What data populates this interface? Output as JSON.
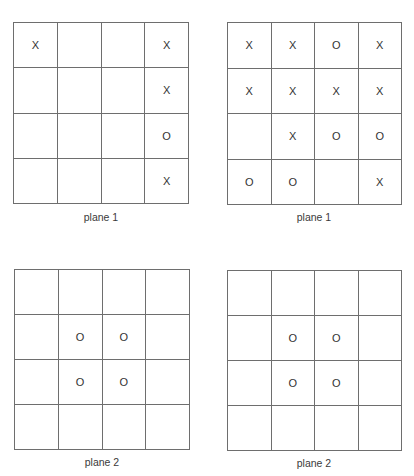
{
  "boards": [
    {
      "id": "top-left",
      "label": "plane 1",
      "cells": [
        [
          "X",
          "",
          "",
          "X"
        ],
        [
          "",
          "",
          "",
          "X"
        ],
        [
          "",
          "",
          "",
          "O"
        ],
        [
          "",
          "",
          "",
          "X"
        ]
      ]
    },
    {
      "id": "top-right",
      "label": "plane 1",
      "cells": [
        [
          "X",
          "X",
          "O",
          "X"
        ],
        [
          "X",
          "X",
          "X",
          "X"
        ],
        [
          "",
          "X",
          "O",
          "O"
        ],
        [
          "O",
          "O",
          "",
          "X"
        ]
      ]
    },
    {
      "id": "bottom-left",
      "label": "plane 2",
      "cells": [
        [
          "",
          "",
          "",
          ""
        ],
        [
          "",
          "O",
          "O",
          ""
        ],
        [
          "",
          "O",
          "O",
          ""
        ],
        [
          "",
          "",
          "",
          ""
        ]
      ]
    },
    {
      "id": "bottom-right",
      "label": "plane 2",
      "cells": [
        [
          "",
          "",
          "",
          ""
        ],
        [
          "",
          "O",
          "O",
          ""
        ],
        [
          "",
          "O",
          "O",
          ""
        ],
        [
          "",
          "",
          "",
          ""
        ]
      ]
    }
  ],
  "colors": {
    "grid_line": "#6e6e6e",
    "text": "#333333",
    "background": "#ffffff"
  }
}
